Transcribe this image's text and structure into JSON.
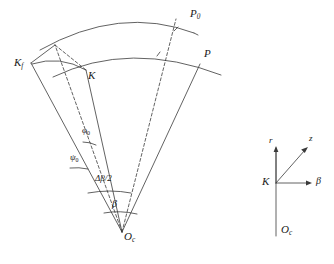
{
  "figure": {
    "kind": "geometry-diagram",
    "background_color": "#ffffff",
    "stroke_color": "#3a3a3a",
    "label_color": "#1a1a1a",
    "width": 334,
    "height": 264,
    "main_panel": {
      "name": "annular-sector-diagram",
      "apex_label": "O",
      "apex_subscript": "c",
      "points": [
        {
          "id": "P0",
          "label": "P",
          "subscript": "0",
          "x": 192,
          "y": 14
        },
        {
          "id": "P",
          "label": "P",
          "subscript": "",
          "x": 206,
          "y": 55
        },
        {
          "id": "Kf",
          "label": "K",
          "subscript": "f",
          "x": 21,
          "y": 64
        },
        {
          "id": "K",
          "label": "K",
          "subscript": "",
          "x": 90,
          "y": 75
        },
        {
          "id": "Oc",
          "label": "O",
          "subscript": "c",
          "x": 122,
          "y": 238
        }
      ],
      "angles": [
        {
          "id": "phi0",
          "label": "φ",
          "subscript": "0",
          "x": 84,
          "y": 130
        },
        {
          "id": "psi0",
          "label": "ψ",
          "subscript": "0",
          "x": 74,
          "y": 157
        },
        {
          "id": "dbeta2",
          "label": "Δβ/2",
          "subscript": "",
          "x": 103,
          "y": 178
        },
        {
          "id": "beta",
          "label": "β",
          "subscript": "",
          "x": 111,
          "y": 203
        }
      ]
    },
    "inset_panel": {
      "name": "local-coordinate-frame",
      "origin_label": "K",
      "origin_x": 276,
      "origin_y": 183,
      "lower_label": "O",
      "lower_subscript": "c",
      "axes": [
        {
          "id": "r",
          "label": "r",
          "x": 272,
          "y": 143
        },
        {
          "id": "z",
          "label": "z",
          "x": 312,
          "y": 139
        },
        {
          "id": "beta",
          "label": "β",
          "x": 318,
          "y": 179
        }
      ]
    }
  }
}
